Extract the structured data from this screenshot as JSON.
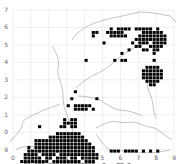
{
  "map": {
    "type": "distribution-grid-map",
    "grid_color": "#e4e4e4",
    "outline_color": "#9a9a9a",
    "cell_color": "#000000",
    "x_labels": [
      "0",
      "1",
      "2",
      "3",
      "4",
      "5",
      "6",
      "7",
      "8",
      "9"
    ],
    "y_labels": [
      "7",
      "6",
      "5",
      "4",
      "3",
      "2",
      "1",
      "0",
      "9"
    ],
    "origin": {
      "x": 13,
      "y": 10
    },
    "major_step": {
      "x": 17.9,
      "y": 17.45
    },
    "cell_size": {
      "x": 3.58,
      "y": 3.49
    },
    "cells": [
      [
        27,
        5
      ],
      [
        29,
        5
      ],
      [
        30,
        5
      ],
      [
        31,
        5
      ],
      [
        32,
        5
      ],
      [
        34,
        5
      ],
      [
        35,
        5
      ],
      [
        36,
        5
      ],
      [
        37,
        5
      ],
      [
        38,
        5
      ],
      [
        40,
        5
      ],
      [
        22,
        6
      ],
      [
        23,
        6
      ],
      [
        26,
        6
      ],
      [
        27,
        6
      ],
      [
        28,
        6
      ],
      [
        29,
        6
      ],
      [
        30,
        6
      ],
      [
        36,
        6
      ],
      [
        37,
        6
      ],
      [
        38,
        6
      ],
      [
        39,
        6
      ],
      [
        40,
        6
      ],
      [
        41,
        6
      ],
      [
        22,
        7
      ],
      [
        27,
        7
      ],
      [
        28,
        7
      ],
      [
        29,
        7
      ],
      [
        30,
        7
      ],
      [
        31,
        7
      ],
      [
        35,
        7
      ],
      [
        36,
        7
      ],
      [
        37,
        7
      ],
      [
        38,
        7
      ],
      [
        39,
        7
      ],
      [
        40,
        7
      ],
      [
        41,
        7
      ],
      [
        42,
        7
      ],
      [
        34,
        8
      ],
      [
        35,
        8
      ],
      [
        36,
        8
      ],
      [
        37,
        8
      ],
      [
        38,
        8
      ],
      [
        39,
        8
      ],
      [
        40,
        8
      ],
      [
        41,
        8
      ],
      [
        42,
        8
      ],
      [
        25,
        9
      ],
      [
        33,
        9
      ],
      [
        35,
        9
      ],
      [
        36,
        9
      ],
      [
        37,
        9
      ],
      [
        39,
        9
      ],
      [
        40,
        9
      ],
      [
        41,
        9
      ],
      [
        42,
        9
      ],
      [
        34,
        10
      ],
      [
        35,
        10
      ],
      [
        38,
        10
      ],
      [
        39,
        10
      ],
      [
        40,
        10
      ],
      [
        41,
        10
      ],
      [
        32,
        11
      ],
      [
        36,
        11
      ],
      [
        37,
        11
      ],
      [
        39,
        11
      ],
      [
        40,
        11
      ],
      [
        30,
        12
      ],
      [
        39,
        12
      ],
      [
        20,
        14
      ],
      [
        28,
        14
      ],
      [
        30,
        14
      ],
      [
        31,
        14
      ],
      [
        39,
        14
      ],
      [
        37,
        16
      ],
      [
        38,
        16
      ],
      [
        39,
        16
      ],
      [
        40,
        16
      ],
      [
        36,
        17
      ],
      [
        37,
        17
      ],
      [
        38,
        17
      ],
      [
        39,
        17
      ],
      [
        40,
        17
      ],
      [
        41,
        17
      ],
      [
        36,
        18
      ],
      [
        37,
        18
      ],
      [
        38,
        18
      ],
      [
        39,
        18
      ],
      [
        40,
        18
      ],
      [
        41,
        18
      ],
      [
        36,
        19
      ],
      [
        37,
        19
      ],
      [
        38,
        19
      ],
      [
        39,
        19
      ],
      [
        40,
        19
      ],
      [
        41,
        19
      ],
      [
        37,
        20
      ],
      [
        38,
        20
      ],
      [
        39,
        20
      ],
      [
        40,
        20
      ],
      [
        38,
        21
      ],
      [
        39,
        21
      ],
      [
        17,
        23
      ],
      [
        16,
        25
      ],
      [
        23,
        25
      ],
      [
        15,
        27
      ],
      [
        17,
        27
      ],
      [
        18,
        27
      ],
      [
        19,
        27
      ],
      [
        20,
        27
      ],
      [
        21,
        27
      ],
      [
        17,
        28
      ],
      [
        18,
        28
      ],
      [
        19,
        28
      ],
      [
        20,
        28
      ],
      [
        22,
        28
      ],
      [
        14,
        31
      ],
      [
        16,
        31
      ],
      [
        17,
        31
      ],
      [
        14,
        32
      ],
      [
        15,
        32
      ],
      [
        16,
        32
      ],
      [
        17,
        32
      ],
      [
        7,
        33
      ],
      [
        13,
        33
      ],
      [
        14,
        33
      ],
      [
        16,
        33
      ],
      [
        17,
        33
      ],
      [
        12,
        35
      ],
      [
        13,
        35
      ],
      [
        14,
        35
      ],
      [
        15,
        35
      ],
      [
        16,
        35
      ],
      [
        17,
        35
      ],
      [
        18,
        35
      ],
      [
        10,
        36
      ],
      [
        11,
        36
      ],
      [
        12,
        36
      ],
      [
        13,
        36
      ],
      [
        14,
        36
      ],
      [
        15,
        36
      ],
      [
        16,
        36
      ],
      [
        17,
        36
      ],
      [
        18,
        36
      ],
      [
        19,
        36
      ],
      [
        6,
        37
      ],
      [
        7,
        37
      ],
      [
        8,
        37
      ],
      [
        9,
        37
      ],
      [
        10,
        37
      ],
      [
        11,
        37
      ],
      [
        12,
        37
      ],
      [
        13,
        37
      ],
      [
        14,
        37
      ],
      [
        15,
        37
      ],
      [
        16,
        37
      ],
      [
        17,
        37
      ],
      [
        18,
        37
      ],
      [
        19,
        37
      ],
      [
        20,
        37
      ],
      [
        6,
        38
      ],
      [
        7,
        38
      ],
      [
        8,
        38
      ],
      [
        9,
        38
      ],
      [
        10,
        38
      ],
      [
        11,
        38
      ],
      [
        12,
        38
      ],
      [
        13,
        38
      ],
      [
        14,
        38
      ],
      [
        15,
        38
      ],
      [
        16,
        38
      ],
      [
        17,
        38
      ],
      [
        18,
        38
      ],
      [
        19,
        38
      ],
      [
        20,
        38
      ],
      [
        21,
        38
      ],
      [
        4,
        39
      ],
      [
        6,
        39
      ],
      [
        7,
        39
      ],
      [
        8,
        39
      ],
      [
        9,
        39
      ],
      [
        10,
        39
      ],
      [
        11,
        39
      ],
      [
        12,
        39
      ],
      [
        13,
        39
      ],
      [
        14,
        39
      ],
      [
        15,
        39
      ],
      [
        16,
        39
      ],
      [
        17,
        39
      ],
      [
        18,
        39
      ],
      [
        19,
        39
      ],
      [
        20,
        39
      ],
      [
        21,
        39
      ],
      [
        22,
        39
      ],
      [
        4,
        40
      ],
      [
        5,
        40
      ],
      [
        6,
        40
      ],
      [
        7,
        40
      ],
      [
        8,
        40
      ],
      [
        9,
        40
      ],
      [
        10,
        40
      ],
      [
        11,
        40
      ],
      [
        12,
        40
      ],
      [
        13,
        40
      ],
      [
        14,
        40
      ],
      [
        15,
        40
      ],
      [
        16,
        40
      ],
      [
        17,
        40
      ],
      [
        18,
        40
      ],
      [
        19,
        40
      ],
      [
        20,
        40
      ],
      [
        21,
        40
      ],
      [
        22,
        40
      ],
      [
        27,
        40
      ],
      [
        28,
        40
      ],
      [
        29,
        40
      ],
      [
        31,
        40
      ],
      [
        32,
        40
      ],
      [
        33,
        40
      ],
      [
        34,
        40
      ],
      [
        36,
        40
      ],
      [
        38,
        40
      ],
      [
        40,
        40
      ],
      [
        3,
        41
      ],
      [
        4,
        41
      ],
      [
        5,
        41
      ],
      [
        6,
        41
      ],
      [
        8,
        41
      ],
      [
        9,
        41
      ],
      [
        10,
        41
      ],
      [
        11,
        41
      ],
      [
        13,
        41
      ],
      [
        14,
        41
      ],
      [
        15,
        41
      ],
      [
        16,
        41
      ],
      [
        17,
        41
      ],
      [
        18,
        41
      ],
      [
        19,
        41
      ],
      [
        20,
        41
      ],
      [
        21,
        41
      ],
      [
        22,
        41
      ],
      [
        23,
        41
      ],
      [
        3,
        42
      ],
      [
        4,
        42
      ],
      [
        5,
        42
      ],
      [
        6,
        42
      ],
      [
        7,
        42
      ],
      [
        9,
        42
      ],
      [
        10,
        42
      ],
      [
        12,
        42
      ],
      [
        13,
        42
      ],
      [
        14,
        42
      ],
      [
        16,
        42
      ],
      [
        17,
        42
      ],
      [
        19,
        42
      ],
      [
        20,
        42
      ],
      [
        21,
        42
      ],
      [
        22,
        42
      ],
      [
        23,
        42
      ],
      [
        2,
        43
      ],
      [
        3,
        43
      ],
      [
        4,
        43
      ],
      [
        5,
        43
      ],
      [
        6,
        43
      ],
      [
        7,
        43
      ],
      [
        8,
        43
      ],
      [
        9,
        43
      ],
      [
        11,
        43
      ],
      [
        12,
        43
      ],
      [
        13,
        43
      ],
      [
        14,
        43
      ],
      [
        15,
        43
      ],
      [
        16,
        43
      ],
      [
        17,
        43
      ],
      [
        18,
        43
      ],
      [
        20,
        43
      ],
      [
        21,
        43
      ],
      [
        22,
        43
      ],
      [
        3,
        44
      ],
      [
        4,
        44
      ],
      [
        6,
        44
      ],
      [
        7,
        44
      ],
      [
        8,
        44
      ],
      [
        10,
        44
      ],
      [
        11,
        44
      ],
      [
        12,
        44
      ],
      [
        13,
        44
      ],
      [
        14,
        44
      ],
      [
        15,
        44
      ],
      [
        16,
        44
      ],
      [
        17,
        44
      ],
      [
        18,
        44
      ],
      [
        19,
        44
      ],
      [
        20,
        44
      ],
      [
        21,
        44
      ],
      [
        22,
        44
      ],
      [
        25,
        44
      ],
      [
        29,
        44
      ],
      [
        30,
        44
      ],
      [
        32,
        44
      ],
      [
        3,
        45
      ],
      [
        4,
        45
      ],
      [
        5,
        45
      ],
      [
        6,
        45
      ],
      [
        7,
        45
      ],
      [
        8,
        45
      ],
      [
        9,
        45
      ],
      [
        10,
        45
      ],
      [
        11,
        45
      ],
      [
        12,
        45
      ],
      [
        13,
        45
      ],
      [
        14,
        45
      ],
      [
        15,
        45
      ],
      [
        16,
        45
      ],
      [
        17,
        45
      ],
      [
        18,
        45
      ],
      [
        19,
        45
      ],
      [
        20,
        45
      ],
      [
        21,
        45
      ],
      [
        22,
        45
      ],
      [
        24,
        45
      ],
      [
        27,
        45
      ],
      [
        28,
        45
      ],
      [
        31,
        45
      ],
      [
        4,
        46
      ],
      [
        5,
        46
      ],
      [
        6,
        46
      ],
      [
        7,
        46
      ],
      [
        8,
        46
      ],
      [
        9,
        46
      ],
      [
        10,
        46
      ],
      [
        11,
        46
      ],
      [
        12,
        46
      ],
      [
        13,
        46
      ],
      [
        14,
        46
      ],
      [
        15,
        46
      ],
      [
        16,
        46
      ],
      [
        17,
        46
      ],
      [
        18,
        46
      ],
      [
        19,
        46
      ],
      [
        20,
        46
      ],
      [
        21,
        46
      ],
      [
        22,
        46
      ],
      [
        23,
        46
      ],
      [
        25,
        46
      ],
      [
        28,
        46
      ],
      [
        5,
        47
      ],
      [
        6,
        47
      ],
      [
        7,
        47
      ],
      [
        8,
        47
      ],
      [
        9,
        47
      ],
      [
        10,
        47
      ],
      [
        12,
        47
      ],
      [
        13,
        47
      ],
      [
        14,
        47
      ],
      [
        15,
        47
      ],
      [
        16,
        47
      ],
      [
        17,
        47
      ],
      [
        18,
        47
      ],
      [
        19,
        47
      ],
      [
        20,
        47
      ],
      [
        21,
        47
      ],
      [
        22,
        47
      ],
      [
        23,
        47
      ],
      [
        24,
        47
      ],
      [
        32,
        47
      ],
      [
        33,
        47
      ],
      [
        34,
        47
      ],
      [
        35,
        47
      ],
      [
        37,
        47
      ],
      [
        4,
        48
      ],
      [
        5,
        48
      ],
      [
        7,
        48
      ],
      [
        8,
        48
      ],
      [
        9,
        48
      ],
      [
        10,
        48
      ],
      [
        11,
        48
      ],
      [
        13,
        48
      ],
      [
        14,
        48
      ],
      [
        16,
        48
      ],
      [
        17,
        48
      ],
      [
        18,
        48
      ],
      [
        19,
        48
      ],
      [
        20,
        48
      ],
      [
        21,
        48
      ],
      [
        22,
        48
      ],
      [
        23,
        48
      ],
      [
        24,
        48
      ],
      [
        25,
        48
      ],
      [
        26,
        48
      ],
      [
        27,
        48
      ],
      [
        28,
        48
      ],
      [
        33,
        48
      ],
      [
        34,
        48
      ],
      [
        35,
        48
      ],
      [
        36,
        48
      ],
      [
        37,
        48
      ],
      [
        3,
        49
      ],
      [
        5,
        49
      ],
      [
        6,
        49
      ],
      [
        8,
        49
      ],
      [
        9,
        49
      ],
      [
        10,
        49
      ],
      [
        11,
        49
      ],
      [
        12,
        49
      ],
      [
        14,
        49
      ],
      [
        15,
        49
      ],
      [
        16,
        49
      ],
      [
        17,
        49
      ],
      [
        18,
        49
      ],
      [
        20,
        49
      ],
      [
        21,
        49
      ],
      [
        23,
        49
      ],
      [
        24,
        49
      ],
      [
        25,
        49
      ],
      [
        26,
        49
      ],
      [
        27,
        49
      ],
      [
        29,
        49
      ],
      [
        8,
        50
      ],
      [
        9,
        50
      ],
      [
        10,
        50
      ],
      [
        15,
        50
      ],
      [
        16,
        50
      ],
      [
        17,
        50
      ],
      [
        19,
        50
      ],
      [
        22,
        50
      ],
      [
        23,
        50
      ],
      [
        1,
        51
      ],
      [
        10,
        51
      ],
      [
        11,
        51
      ],
      [
        14,
        51
      ],
      [
        15,
        51
      ],
      [
        16,
        51
      ],
      [
        21,
        51
      ],
      [
        2,
        53
      ],
      [
        8,
        53
      ],
      [
        9,
        53
      ],
      [
        10,
        53
      ],
      [
        17,
        53
      ]
    ]
  }
}
